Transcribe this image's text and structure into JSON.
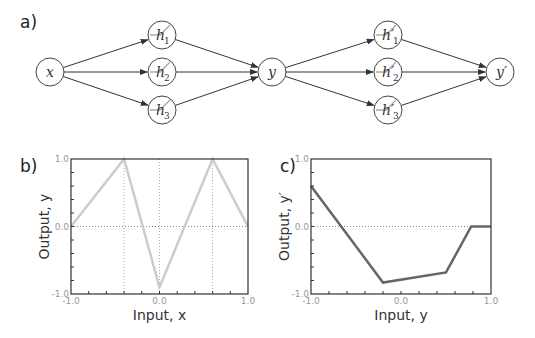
{
  "panels": {
    "a": {
      "label": "a)"
    },
    "b": {
      "label": "b)"
    },
    "c": {
      "label": "c)"
    }
  },
  "network": {
    "nodes": [
      {
        "id": "x",
        "label": "x",
        "sub": "",
        "prime": false
      },
      {
        "id": "h1",
        "label": "h",
        "sub": "1",
        "prime": false
      },
      {
        "id": "h2",
        "label": "h",
        "sub": "2",
        "prime": false
      },
      {
        "id": "h3",
        "label": "h",
        "sub": "3",
        "prime": false
      },
      {
        "id": "y",
        "label": "y",
        "sub": "",
        "prime": false
      },
      {
        "id": "h1p",
        "label": "h′",
        "sub": "1",
        "prime": true
      },
      {
        "id": "h2p",
        "label": "h′",
        "sub": "2",
        "prime": true
      },
      {
        "id": "h3p",
        "label": "h′",
        "sub": "3",
        "prime": true
      },
      {
        "id": "yp",
        "label": "y′",
        "sub": "",
        "prime": true
      }
    ],
    "edges": [
      [
        "x",
        "h1"
      ],
      [
        "x",
        "h2"
      ],
      [
        "x",
        "h3"
      ],
      [
        "h1",
        "y"
      ],
      [
        "h2",
        "y"
      ],
      [
        "h3",
        "y"
      ],
      [
        "y",
        "h1p"
      ],
      [
        "y",
        "h2p"
      ],
      [
        "y",
        "h3p"
      ],
      [
        "h1p",
        "yp"
      ],
      [
        "h2p",
        "yp"
      ],
      [
        "h3p",
        "yp"
      ]
    ]
  },
  "chart_data": [
    {
      "type": "line",
      "panel": "b",
      "x": [
        -1.0,
        -0.4,
        0.0,
        0.6,
        1.0
      ],
      "values": [
        0.0,
        1.0,
        -0.9,
        1.0,
        0.0
      ],
      "xlabel": "Input, x",
      "ylabel": "Output, y",
      "xlim": [
        -1.0,
        1.0
      ],
      "ylim": [
        -1.0,
        1.0
      ],
      "xticks": [
        "-1.0",
        "0.0",
        "1.0"
      ],
      "yticks": [
        "-1.0",
        "0.0",
        "1.0"
      ],
      "color": "#cccccc",
      "vlines": [
        -0.4,
        0.0,
        0.6
      ],
      "hline": 0.0
    },
    {
      "type": "line",
      "panel": "c",
      "x": [
        -1.0,
        -0.2,
        0.5,
        0.78,
        1.0
      ],
      "values": [
        0.6,
        -0.83,
        -0.68,
        0.0,
        0.0
      ],
      "xlabel": "Input, y",
      "ylabel": "Output, y′",
      "xlim": [
        -1.0,
        1.0
      ],
      "ylim": [
        -1.0,
        1.0
      ],
      "xticks": [
        "-1.0",
        "0.0",
        "1.0"
      ],
      "yticks": [
        "-1.0",
        "0.0",
        "1.0"
      ],
      "color": "#666666",
      "hline": 0.0
    }
  ]
}
